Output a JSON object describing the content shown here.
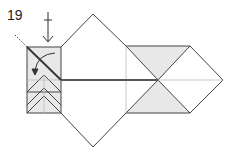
{
  "diagram": {
    "type": "origami-fold-step",
    "step_number": "19",
    "colors": {
      "line": "#444444",
      "shade": "#e8e8e8",
      "light_line": "#bbbbbb"
    }
  }
}
